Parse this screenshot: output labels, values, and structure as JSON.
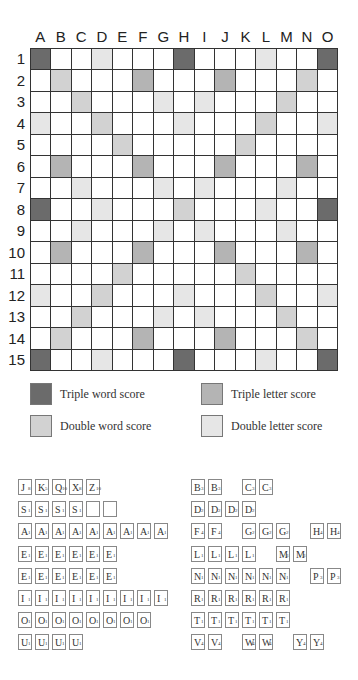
{
  "board": {
    "columns": [
      "A",
      "B",
      "C",
      "D",
      "E",
      "F",
      "G",
      "H",
      "I",
      "J",
      "K",
      "L",
      "M",
      "N",
      "O"
    ],
    "rows": [
      "1",
      "2",
      "3",
      "4",
      "5",
      "6",
      "7",
      "8",
      "9",
      "10",
      "11",
      "12",
      "13",
      "14",
      "15"
    ],
    "layout": [
      "T..d...T...d..T",
      ".D...t...t...D.",
      "..D...d.d...D..",
      "d..D...d...D..d",
      "....D.....D....",
      ".t...t...t...t.",
      "..d...d.d...d..",
      "T..d...D...d..T",
      "..d...d.d...d..",
      ".t...t...t...t.",
      "....D.....D....",
      "d..D...d...D..d",
      "..D...d.d...D..",
      ".D...t...t...D.",
      "T..d...T...d..T"
    ],
    "colors": {
      "triple_word": "#6b6b6b",
      "triple_letter": "#b4b4b4",
      "double_word": "#d2d2d2",
      "double_letter": "#e6e6e6",
      "plain": "#ffffff"
    }
  },
  "legend": {
    "triple_word": "Triple word score",
    "double_word": "Double word score",
    "triple_letter": "Triple letter score",
    "double_letter": "Double letter score"
  },
  "tiles": {
    "left": [
      [
        [
          "J",
          "8"
        ],
        [
          "K",
          "5"
        ],
        [
          "Q",
          "10"
        ],
        [
          "X",
          "8"
        ],
        [
          "Z",
          "10"
        ]
      ],
      [
        [
          "S",
          "1"
        ],
        [
          "S",
          "1"
        ],
        [
          "S",
          "1"
        ],
        [
          "S",
          "1"
        ],
        [
          "",
          ""
        ],
        [
          "",
          ""
        ]
      ],
      [
        [
          "A",
          "1"
        ],
        [
          "A",
          "1"
        ],
        [
          "A",
          "1"
        ],
        [
          "A",
          "1"
        ],
        [
          "A",
          "1"
        ],
        [
          "A",
          "1"
        ],
        [
          "A",
          "1"
        ],
        [
          "A",
          "1"
        ],
        [
          "A",
          "1"
        ]
      ],
      [
        [
          "E",
          "1"
        ],
        [
          "E",
          "1"
        ],
        [
          "E",
          "1"
        ],
        [
          "E",
          "1"
        ],
        [
          "E",
          "1"
        ],
        [
          "E",
          "1"
        ]
      ],
      [
        [
          "E",
          "1"
        ],
        [
          "E",
          "1"
        ],
        [
          "E",
          "1"
        ],
        [
          "E",
          "1"
        ],
        [
          "E",
          "1"
        ],
        [
          "E",
          "1"
        ]
      ],
      [
        [
          "I",
          "1"
        ],
        [
          "I",
          "1"
        ],
        [
          "I",
          "1"
        ],
        [
          "I",
          "1"
        ],
        [
          "I",
          "1"
        ],
        [
          "I",
          "1"
        ],
        [
          "I",
          "1"
        ],
        [
          "I",
          "1"
        ],
        [
          "I",
          "1"
        ]
      ],
      [
        [
          "O",
          "1"
        ],
        [
          "O",
          "1"
        ],
        [
          "O",
          "1"
        ],
        [
          "O",
          "1"
        ],
        [
          "O",
          "1"
        ],
        [
          "O",
          "1"
        ],
        [
          "O",
          "1"
        ],
        [
          "O",
          "1"
        ]
      ],
      [
        [
          "U",
          "1"
        ],
        [
          "U",
          "1"
        ],
        [
          "U",
          "1"
        ],
        [
          "U",
          "1"
        ]
      ]
    ],
    "right": [
      [
        [
          0,
          "B",
          "3"
        ],
        [
          1,
          "B",
          "3"
        ],
        [
          3,
          "C",
          "3"
        ],
        [
          4,
          "C",
          "3"
        ]
      ],
      [
        [
          0,
          "D",
          "2"
        ],
        [
          1,
          "D",
          "2"
        ],
        [
          2,
          "D",
          "2"
        ],
        [
          3,
          "D",
          "2"
        ]
      ],
      [
        [
          0,
          "F",
          "4"
        ],
        [
          1,
          "F",
          "4"
        ],
        [
          3,
          "G",
          "2"
        ],
        [
          4,
          "G",
          "2"
        ],
        [
          5,
          "G",
          "2"
        ],
        [
          7,
          "H",
          "4"
        ],
        [
          8,
          "H",
          "4"
        ]
      ],
      [
        [
          0,
          "L",
          "1"
        ],
        [
          1,
          "L",
          "1"
        ],
        [
          2,
          "L",
          "1"
        ],
        [
          3,
          "L",
          "1"
        ],
        [
          5,
          "M",
          "3"
        ],
        [
          6,
          "M",
          "3"
        ]
      ],
      [
        [
          0,
          "N",
          "1"
        ],
        [
          1,
          "N",
          "1"
        ],
        [
          2,
          "N",
          "1"
        ],
        [
          3,
          "N",
          "1"
        ],
        [
          4,
          "N",
          "1"
        ],
        [
          5,
          "N",
          "1"
        ],
        [
          7,
          "P",
          "3"
        ],
        [
          8,
          "P",
          "3"
        ]
      ],
      [
        [
          0,
          "R",
          "1"
        ],
        [
          1,
          "R",
          "1"
        ],
        [
          2,
          "R",
          "1"
        ],
        [
          3,
          "R",
          "1"
        ],
        [
          4,
          "R",
          "1"
        ],
        [
          5,
          "R",
          "1"
        ]
      ],
      [
        [
          0,
          "T",
          "1"
        ],
        [
          1,
          "T",
          "1"
        ],
        [
          2,
          "T",
          "1"
        ],
        [
          3,
          "T",
          "1"
        ],
        [
          4,
          "T",
          "1"
        ],
        [
          5,
          "T",
          "1"
        ]
      ],
      [
        [
          0,
          "V",
          "4"
        ],
        [
          1,
          "V",
          "4"
        ],
        [
          3,
          "W",
          "4"
        ],
        [
          4,
          "W",
          "4"
        ],
        [
          6,
          "Y",
          "4"
        ],
        [
          7,
          "Y",
          "4"
        ]
      ]
    ]
  }
}
